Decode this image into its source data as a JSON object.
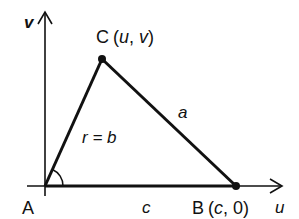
{
  "diagram": {
    "axes": {
      "vertical_label": "v",
      "horizontal_label": "u"
    },
    "vertices": {
      "A": {
        "label": "A",
        "x": 45,
        "y": 186
      },
      "B": {
        "label": "B",
        "coords_open": "(",
        "coord_x": "c",
        "coord_sep": ", ",
        "coord_y": "0",
        "coords_close": ")",
        "x": 236,
        "y": 186
      },
      "C": {
        "label": "C",
        "coords_open": "(",
        "coord_x": "u",
        "coord_sep": ", ",
        "coord_y": "v",
        "coords_close": ")",
        "x": 102,
        "y": 59
      }
    },
    "sides": {
      "a": "a",
      "b_label": "r = b",
      "c": "c"
    },
    "colors": {
      "stroke": "#111111",
      "background": "#ffffff"
    }
  }
}
